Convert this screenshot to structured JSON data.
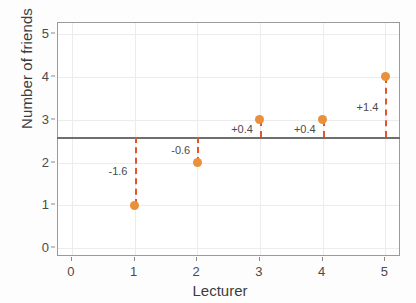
{
  "chart_data": {
    "type": "scatter",
    "title": "",
    "xlabel": "Lecturer",
    "ylabel": "Number of friends",
    "x": [
      1,
      2,
      3,
      4,
      5
    ],
    "values": [
      1,
      2,
      3,
      3,
      4
    ],
    "categories": [
      "1",
      "2",
      "3",
      "4",
      "5"
    ],
    "xlim": [
      -0.22,
      5.25
    ],
    "ylim": [
      -0.2,
      5.25
    ],
    "xticks": [
      "0",
      "1",
      "2",
      "3",
      "4",
      "5"
    ],
    "xtick_values": [
      0,
      1,
      2,
      3,
      4,
      5
    ],
    "yticks": [
      "0",
      "1",
      "2",
      "3",
      "4",
      "5"
    ],
    "ytick_values": [
      0,
      1,
      2,
      3,
      4,
      5
    ],
    "grid": true,
    "legend": "none",
    "mean_line": {
      "value": 2.6,
      "color": "#6f6f6f",
      "style": "solid"
    },
    "point_color": "#e8913a",
    "deviation_line_color": "#df5630",
    "deviation_line_style": "dashed",
    "points": [
      {
        "x": 1,
        "y": 1,
        "deviation": "-1.6",
        "label_y": 1.8
      },
      {
        "x": 2,
        "y": 2,
        "deviation": "-0.6",
        "label_y": 2.3
      },
      {
        "x": 3,
        "y": 3,
        "deviation": "+0.4",
        "label_y": 2.78
      },
      {
        "x": 4,
        "y": 3,
        "deviation": "+0.4",
        "label_y": 2.78
      },
      {
        "x": 5,
        "y": 4,
        "deviation": "+1.4",
        "label_y": 3.3
      }
    ],
    "annotations": [
      "-1.6",
      "-0.6",
      "+0.4",
      "+0.4",
      "+1.4"
    ]
  }
}
